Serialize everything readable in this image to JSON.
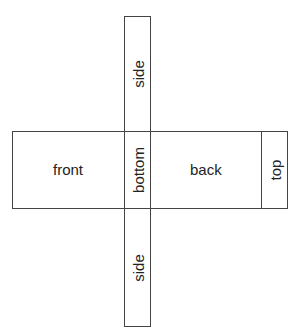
{
  "diagram": {
    "type": "box net",
    "faces": {
      "side_top": "side",
      "front": "front",
      "bottom": "bottom",
      "back": "back",
      "top": "top",
      "side_bottom": "side"
    }
  }
}
